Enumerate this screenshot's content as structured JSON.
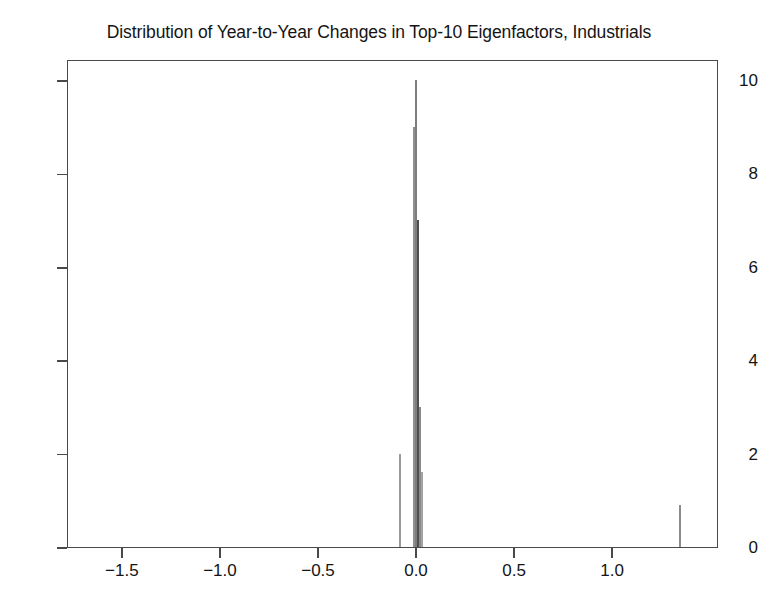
{
  "chart_data": {
    "type": "bar",
    "title": "Distribution of Year-to-Year Changes in Top-10 Eigenfactors, Industrials",
    "subtitle": "",
    "xlabel": "",
    "ylabel": "",
    "xlim": [
      -1.78,
      1.54
    ],
    "ylim": [
      0,
      10.45
    ],
    "grid": false,
    "legend": "none",
    "xticks": [
      -1.5,
      -1.0,
      -0.5,
      0.0,
      0.5,
      1.0
    ],
    "xtick_labels": [
      "−1.5",
      "−1.0",
      "−0.5",
      "0.0",
      "0.5",
      "1.0"
    ],
    "yticks": [
      0,
      2,
      4,
      6,
      8,
      10
    ],
    "ytick_labels": [
      "0",
      "2",
      "4",
      "6",
      "8",
      "10"
    ],
    "bar_width": 0.012,
    "note": "Histogram of year-to-year changes; nearly all mass concentrated at zero with a small outlier near 1.34",
    "x": [
      -0.085,
      -0.015,
      -0.005,
      0.012,
      0.022,
      1.34
    ],
    "values": [
      2.0,
      9.0,
      10.0,
      7.0,
      3.0,
      0.9
    ],
    "bars": [
      {
        "x": -0.085,
        "value": 2.0,
        "color": "#9a9a9a",
        "width": 0.011
      },
      {
        "x": -0.015,
        "value": 9.0,
        "color": "#8f8f8f",
        "width": 0.01
      },
      {
        "x": -0.005,
        "value": 10.0,
        "color": "#7d7d7d",
        "width": 0.01
      },
      {
        "x": 0.004,
        "value": 7.0,
        "color": "#4f4f4f",
        "width": 0.012
      },
      {
        "x": 0.016,
        "value": 3.0,
        "color": "#8a8a8a",
        "width": 0.01
      },
      {
        "x": 0.024,
        "value": 1.6,
        "color": "#a3a3a3",
        "width": 0.009
      },
      {
        "x": 1.34,
        "value": 0.9,
        "color": "#8b8b8b",
        "width": 0.009
      }
    ]
  }
}
